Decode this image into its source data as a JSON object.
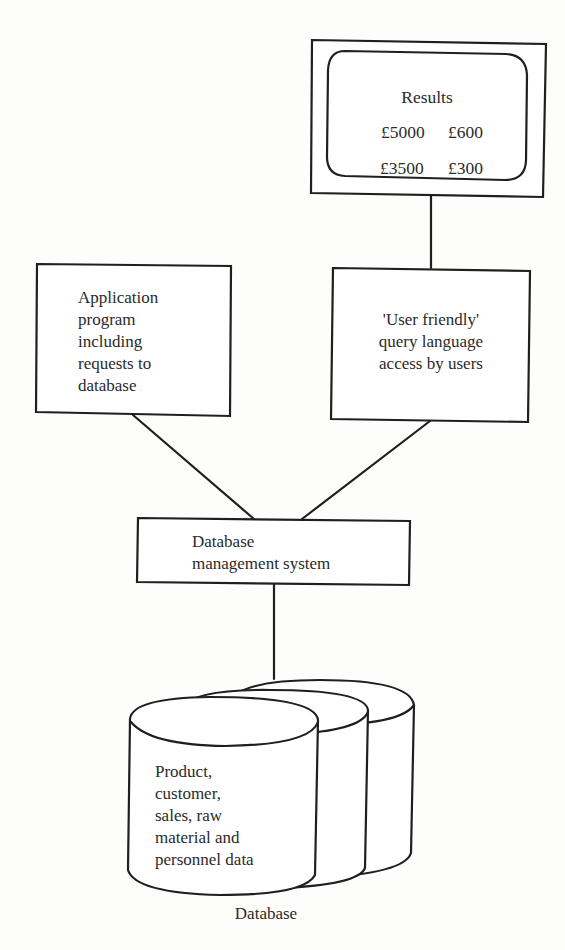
{
  "diagram": {
    "type": "database-architecture",
    "colors": {
      "ink": "#1f1f1f",
      "paper": "#fdfdfb"
    },
    "monitor": {
      "title": "Results",
      "values": [
        [
          "£5000",
          "£600"
        ],
        [
          "£3500",
          "£300"
        ]
      ]
    },
    "application_box": {
      "lines": [
        "Application",
        "program",
        "including",
        "requests to",
        "database"
      ]
    },
    "query_box": {
      "lines": [
        "'User friendly'",
        "query language",
        "access by users"
      ]
    },
    "dbms_box": {
      "lines": [
        "Database",
        "management system"
      ]
    },
    "database": {
      "lines": [
        "Product,",
        "customer,",
        "sales, raw",
        "material and",
        "personnel data"
      ],
      "caption": "Database"
    },
    "connections": [
      {
        "from": "monitor",
        "to": "query_box"
      },
      {
        "from": "application_box",
        "to": "dbms_box"
      },
      {
        "from": "query_box",
        "to": "dbms_box"
      },
      {
        "from": "dbms_box",
        "to": "database"
      }
    ]
  }
}
